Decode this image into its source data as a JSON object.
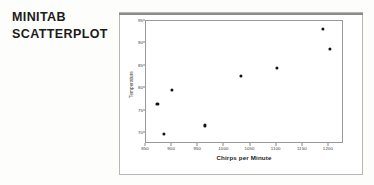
{
  "caption": {
    "line1": "MINITAB",
    "line2": "SCATTERPLOT"
  },
  "colors": {
    "marker": "#111111",
    "axis": "#9a9894",
    "frame": "#b9b7b3",
    "background": "#fdfdfc",
    "plot_background": "#ffffff",
    "text": "#1d1d1d"
  },
  "chart_data": {
    "type": "scatter",
    "title": "",
    "xlabel": "Chirps per Minute",
    "ylabel": "Temperature",
    "xlim": [
      850,
      1225
    ],
    "ylim": [
      68,
      95
    ],
    "grid": false,
    "legend": null,
    "xticks": [
      850,
      900,
      950,
      1000,
      1050,
      1100,
      1150,
      1200
    ],
    "xtick_labels": [
      "850",
      "900",
      "950",
      "1000",
      "1050",
      "1100",
      "1150",
      "1200"
    ],
    "yticks": [
      70,
      75,
      80,
      85,
      90,
      95
    ],
    "ytick_labels": [
      "70",
      "75",
      "80",
      "85",
      "90",
      "95"
    ],
    "series": [
      {
        "name": "Crickets",
        "marker": "circle",
        "points": [
          {
            "x": 872,
            "y": 76.5
          },
          {
            "x": 884,
            "y": 69.8
          },
          {
            "x": 900,
            "y": 79.7
          },
          {
            "x": 962,
            "y": 71.7
          },
          {
            "x": 1032,
            "y": 82.8
          },
          {
            "x": 1100,
            "y": 84.5
          },
          {
            "x": 1188,
            "y": 93.3
          },
          {
            "x": 1202,
            "y": 88.8
          }
        ]
      }
    ]
  }
}
